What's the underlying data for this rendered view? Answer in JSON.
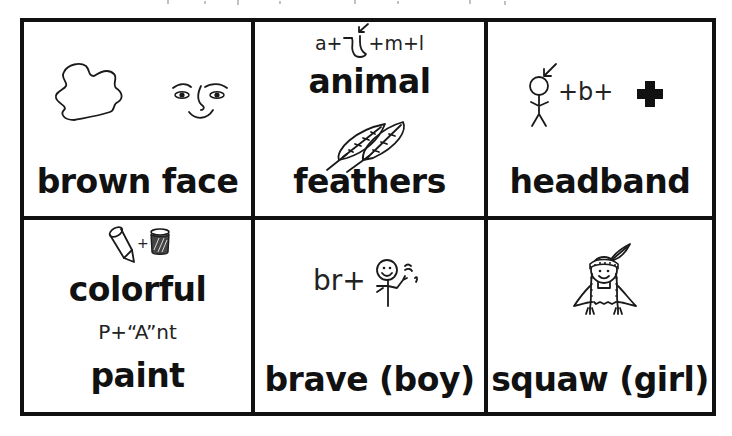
{
  "page": {
    "background": "#ffffff",
    "border_color": "#111111"
  },
  "cells": [
    {
      "id": "brown-face",
      "label": "brown face",
      "hint": "",
      "icons": [
        "brown-blob-icon",
        "smiling-face-icon"
      ]
    },
    {
      "id": "animal-feathers",
      "hint": "a+ʅ+m+l",
      "label_top": "animal",
      "label": "feathers",
      "icons": [
        "leg-arrow-icon",
        "feathers-icon"
      ]
    },
    {
      "id": "headband",
      "label": "headband",
      "hint_parts": [
        "+b+"
      ],
      "icons": [
        "stick-figure-head-arrow-icon",
        "plus-cross-icon"
      ]
    },
    {
      "id": "colorful-paint",
      "label_top": "colorful",
      "hint": "P+“A”nt",
      "label": "paint",
      "icons": [
        "crayon-icon",
        "paint-jar-icon"
      ]
    },
    {
      "id": "brave-boy",
      "hint": "br+",
      "label": "brave (boy)",
      "icons": [
        "waving-stick-figure-icon"
      ]
    },
    {
      "id": "squaw-girl",
      "label": "squaw (girl)",
      "icons": [
        "girl-with-headband-feather-icon"
      ]
    }
  ]
}
